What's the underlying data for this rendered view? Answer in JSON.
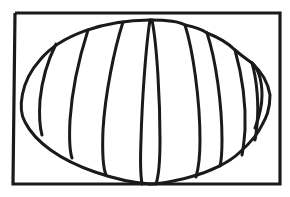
{
  "figure": {
    "description": "Line drawing of a segmented oval (ellipse divided by curved vertical lines) inside a rectangular frame",
    "stroke_color": "#1a1a1a",
    "background_color": "#ffffff",
    "segment_count": 10
  }
}
